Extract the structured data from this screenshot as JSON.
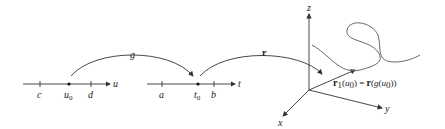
{
  "diagram": {
    "u_axis": {
      "label": "u",
      "ticks": [
        "c",
        "u",
        "d"
      ],
      "tick_sub": "0"
    },
    "t_axis": {
      "label": "t",
      "ticks": [
        "a",
        "t",
        "b"
      ],
      "tick_sub": "0"
    },
    "map_g": {
      "label": "g"
    },
    "map_r": {
      "label": "r"
    },
    "axes_3d": {
      "x": "x",
      "y": "y",
      "z": "z"
    },
    "equation": {
      "lhs_bold": "r",
      "lhs_sub": "1",
      "lhs_arg_open": "(",
      "lhs_arg": "u",
      "lhs_arg_sub": "0",
      "lhs_arg_close": ")",
      "equals": " = ",
      "rhs_bold": "r",
      "rhs_open": "(",
      "rhs_g": "g",
      "rhs_inner_open": "(",
      "rhs_arg": "u",
      "rhs_arg_sub": "0",
      "rhs_close": "))"
    }
  }
}
